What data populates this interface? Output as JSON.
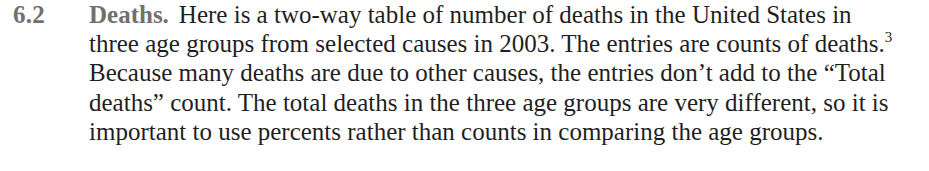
{
  "exercise": {
    "number": "6.2",
    "title": "Deaths.",
    "lines": [
      "Here is a two-way table of number of deaths in the United States in",
      "three age groups from selected causes in 2003. The entries are counts of deaths.",
      "Because many deaths are due to other causes, the entries don’t add to the “Total",
      "deaths” count. The total deaths in the three age groups are very different, so it is",
      "important to use percents rather than counts in comparing the age groups."
    ],
    "footnote_marker": "3"
  },
  "colors": {
    "heading": "#707070",
    "body_text": "#1f1f1f",
    "background": "#ffffff"
  }
}
